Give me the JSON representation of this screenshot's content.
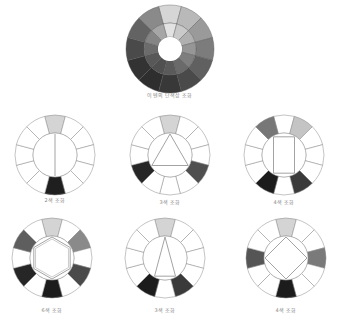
{
  "diagram": {
    "title_wheel": {
      "label": "이텐의 단색상 조화",
      "segments": 12,
      "outer_ring_colors": [
        "#d6d6d6",
        "#b9b9b9",
        "#9a9a9a",
        "#7c7c7c",
        "#606060",
        "#4a4a4a",
        "#383838",
        "#2e2e2e",
        "#333333",
        "#4a4a4a",
        "#636363",
        "#8a8a8a"
      ],
      "inner_ring_colors": [
        "#e2e2e2",
        "#cacaca",
        "#b0b0b0",
        "#969696",
        "#7e7e7e",
        "#6a6a6a",
        "#5a5a5a",
        "#505050",
        "#585858",
        "#6c6c6c",
        "#858585",
        "#a6a6a6"
      ]
    },
    "wheels": [
      {
        "id": "two-color",
        "label": "2색 조화",
        "shape": "line",
        "filled": {
          "0": "#d4d4d4",
          "6": "#1f1f1f"
        }
      },
      {
        "id": "three-color-a",
        "label": "3색 조화",
        "shape": "triangle-equilateral",
        "filled": {
          "0": "#d4d4d4",
          "4": "#4f4f4f",
          "8": "#262626"
        }
      },
      {
        "id": "four-color-a",
        "label": "4색 조화",
        "shape": "rectangle",
        "filled": {
          "1": "#c4c4c4",
          "5": "#3a3a3a",
          "7": "#1c1c1c",
          "11": "#777777"
        }
      },
      {
        "id": "six-color",
        "label": "6색 조화",
        "shape": "hexagon",
        "filled": {
          "0": "#d4d4d4",
          "2": "#8a8a8a",
          "4": "#4a4a4a",
          "6": "#1c1c1c",
          "8": "#262626",
          "10": "#5e5e5e"
        }
      },
      {
        "id": "three-color-b",
        "label": "3색 조화",
        "shape": "triangle-isosceles",
        "filled": {
          "0": "#d4d4d4",
          "5": "#3a3a3a",
          "7": "#1c1c1c"
        }
      },
      {
        "id": "four-color-b",
        "label": "4색 조화",
        "shape": "square",
        "filled": {
          "0": "#d4d4d4",
          "3": "#7a7a7a",
          "6": "#1c1c1c",
          "9": "#555555"
        }
      }
    ]
  }
}
